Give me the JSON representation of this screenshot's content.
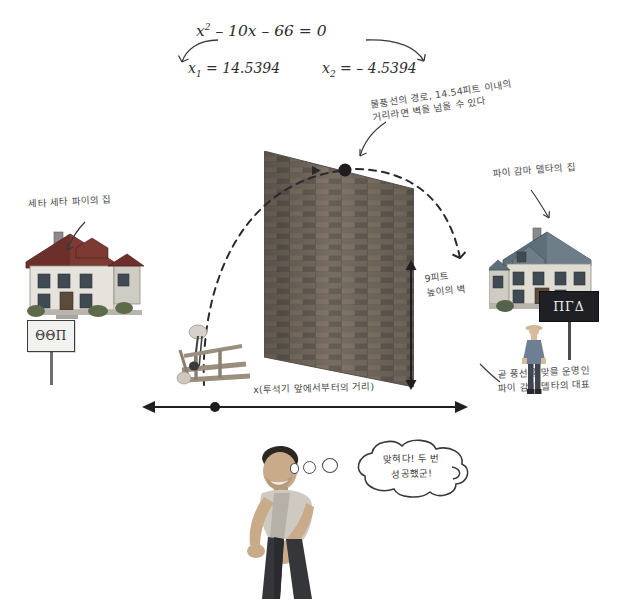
{
  "equation": {
    "expression_lead": "x",
    "expression_sup": "2",
    "expression_rest": " – 10x – 66 = 0",
    "root1_var": "x",
    "root1_sub": "1",
    "root1_value": " = 14.5394",
    "root2_var": "x",
    "root2_sub": "2",
    "root2_value": " = – 4.5394"
  },
  "annotations": {
    "trajectory": "물풍선의 경로, 14.54피트 이내의\n거리라면 벽을 넘을 수 있다",
    "left_house": "세타 세타 파이의 집",
    "right_house": "파이 감마 델타의 집",
    "wall_height": "9피트\n높이의 벽",
    "x_distance": "x(투석기 앞에서부터의 거리)",
    "representative": "곧 풍선을 맞을 운명인\n파이 감마 델타의 대표"
  },
  "signs": {
    "left_house_sign": "ΘΘΠ",
    "right_house_sign": "ΠΓΔ"
  },
  "speech": {
    "bubble_text": "맞혀다! 두 번\n성공했군!"
  },
  "colors": {
    "ink": "#3a3a3c",
    "paper": "#ffffff",
    "wall_brick": "#6b6259",
    "sign_dark": "#1f2024"
  }
}
